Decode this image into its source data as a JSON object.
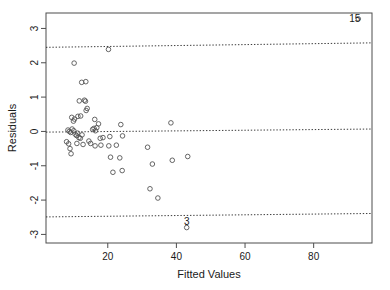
{
  "chart_data": {
    "type": "scatter",
    "title": "",
    "xlabel": "Fitted Values",
    "ylabel": "Residuals",
    "xlim": [
      2,
      97
    ],
    "ylim": [
      -3.25,
      3.45
    ],
    "xticks": [
      20,
      40,
      60,
      80
    ],
    "yticks": [
      3,
      2,
      1,
      0,
      -1,
      -2,
      -3
    ],
    "xtick_labels": [
      "20",
      "40",
      "60",
      "80"
    ],
    "ytick_labels": [
      "3",
      "2",
      "1",
      "0",
      "-1",
      "-2",
      "-3"
    ],
    "grid": false,
    "legend": "none",
    "reference_lines": [
      {
        "name": "upper-bound",
        "style": "dotted",
        "y_left": 2.45,
        "y_right": 2.58
      },
      {
        "name": "zero-line",
        "style": "dotted",
        "y_left": -0.02,
        "y_right": 0.07
      },
      {
        "name": "lower-bound",
        "style": "dotted",
        "y_left": -2.49,
        "y_right": -2.39
      }
    ],
    "annotations": [
      {
        "name": "outlier-15",
        "text": "15",
        "x": 92.0,
        "y": 3.28
      },
      {
        "name": "outlier-3",
        "text": "3",
        "x": 43.0,
        "y": -2.62
      }
    ],
    "points": [
      {
        "x": 20.2,
        "y": 2.39
      },
      {
        "x": 10.2,
        "y": 1.99
      },
      {
        "x": 12.4,
        "y": 1.43
      },
      {
        "x": 13.6,
        "y": 1.45
      },
      {
        "x": 11.7,
        "y": 0.89
      },
      {
        "x": 13.2,
        "y": 0.91
      },
      {
        "x": 13.5,
        "y": 0.88
      },
      {
        "x": 14.0,
        "y": 0.67
      },
      {
        "x": 13.7,
        "y": 0.61
      },
      {
        "x": 9.5,
        "y": 0.41
      },
      {
        "x": 10.0,
        "y": 0.3
      },
      {
        "x": 10.3,
        "y": 0.36
      },
      {
        "x": 11.3,
        "y": 0.44
      },
      {
        "x": 12.1,
        "y": 0.45
      },
      {
        "x": 16.2,
        "y": 0.35
      },
      {
        "x": 17.3,
        "y": 0.22
      },
      {
        "x": 23.8,
        "y": 0.2
      },
      {
        "x": 38.4,
        "y": 0.25
      },
      {
        "x": 8.4,
        "y": 0.04
      },
      {
        "x": 8.8,
        "y": 0.0
      },
      {
        "x": 9.2,
        "y": -0.03
      },
      {
        "x": 9.6,
        "y": 0.07
      },
      {
        "x": 10.1,
        "y": 0.02
      },
      {
        "x": 10.5,
        "y": -0.08
      },
      {
        "x": 10.9,
        "y": -0.12
      },
      {
        "x": 11.2,
        "y": -0.05
      },
      {
        "x": 11.6,
        "y": -0.18
      },
      {
        "x": 12.0,
        "y": -0.2
      },
      {
        "x": 12.5,
        "y": -0.1
      },
      {
        "x": 15.6,
        "y": 0.06
      },
      {
        "x": 16.0,
        "y": 0.09
      },
      {
        "x": 16.4,
        "y": 0.02
      },
      {
        "x": 16.8,
        "y": 0.11
      },
      {
        "x": 8.0,
        "y": -0.3
      },
      {
        "x": 8.6,
        "y": -0.36
      },
      {
        "x": 9.0,
        "y": -0.5
      },
      {
        "x": 9.3,
        "y": -0.65
      },
      {
        "x": 11.0,
        "y": -0.35
      },
      {
        "x": 12.8,
        "y": -0.38
      },
      {
        "x": 14.5,
        "y": -0.28
      },
      {
        "x": 17.8,
        "y": -0.2
      },
      {
        "x": 18.6,
        "y": -0.18
      },
      {
        "x": 20.6,
        "y": -0.15
      },
      {
        "x": 24.3,
        "y": -0.13
      },
      {
        "x": 15.0,
        "y": -0.35
      },
      {
        "x": 16.3,
        "y": -0.42
      },
      {
        "x": 18.0,
        "y": -0.4
      },
      {
        "x": 20.3,
        "y": -0.42
      },
      {
        "x": 22.5,
        "y": -0.4
      },
      {
        "x": 31.6,
        "y": -0.46
      },
      {
        "x": 20.8,
        "y": -0.75
      },
      {
        "x": 23.5,
        "y": -0.77
      },
      {
        "x": 38.8,
        "y": -0.84
      },
      {
        "x": 43.3,
        "y": -0.73
      },
      {
        "x": 33.0,
        "y": -0.95
      },
      {
        "x": 21.5,
        "y": -1.19
      },
      {
        "x": 24.2,
        "y": -1.14
      },
      {
        "x": 32.3,
        "y": -1.67
      },
      {
        "x": 34.6,
        "y": -1.94
      },
      {
        "x": 43.0,
        "y": -2.8
      },
      {
        "x": 93.0,
        "y": 3.28
      }
    ]
  }
}
